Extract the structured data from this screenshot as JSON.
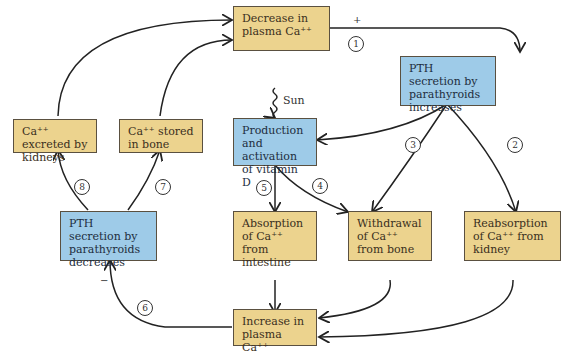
{
  "colors": {
    "regulated_variable": "#ecd38e",
    "hormone_process": "#9ecbe8",
    "line": "#222222"
  },
  "nodes": {
    "decrease_ca": "Decrease in plasma Ca⁺⁺",
    "pth_increase": "PTH secretion by parathyroids increases",
    "vitamin_d": "Production and activation of vitamin D",
    "excreted": "Ca⁺⁺ excreted by kidneys",
    "stored": "Ca⁺⁺ stored in bone",
    "pth_decrease": "PTH secretion by parathyroids decreases",
    "absorption": "Absorption of Ca⁺⁺ from intestine",
    "withdrawal": "Withdrawal of Ca⁺⁺ from bone",
    "reabsorption": "Reabsorption of Ca⁺⁺ from kidney",
    "increase_ca": "Increase in plasma Ca⁺⁺"
  },
  "sun_label": "Sun",
  "signs": {
    "plus": "+",
    "minus": "−"
  },
  "steps": [
    "1",
    "2",
    "3",
    "4",
    "5",
    "6",
    "7",
    "8"
  ]
}
